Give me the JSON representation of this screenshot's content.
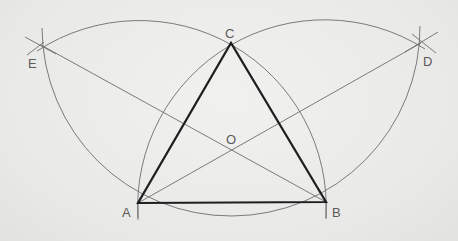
{
  "diagram": {
    "colors": {
      "background": "#ececea",
      "construction": "#6d6d6d",
      "triangle": "#1f1f1f",
      "label": "#5a5a5a"
    },
    "points": {
      "A": {
        "label": "A",
        "x": 138,
        "y": 203
      },
      "B": {
        "label": "B",
        "x": 326,
        "y": 202
      },
      "C": {
        "label": "C",
        "x": 231,
        "y": 43
      },
      "O": {
        "label": "O",
        "x": 231,
        "y": 151
      },
      "D": {
        "label": "D",
        "x": 421,
        "y": 43
      },
      "E": {
        "label": "E",
        "x": 41,
        "y": 45
      }
    },
    "triangle": [
      "A",
      "B",
      "C"
    ],
    "lines": [
      [
        "E",
        "B"
      ],
      [
        "D",
        "A"
      ]
    ],
    "arcs": [
      {
        "center": "A",
        "through": [
          "E",
          "C",
          "B"
        ]
      },
      {
        "center": "B",
        "through": [
          "D",
          "C",
          "A"
        ]
      },
      {
        "center": "C",
        "through": [
          "E",
          "A",
          "B",
          "D"
        ]
      }
    ]
  }
}
